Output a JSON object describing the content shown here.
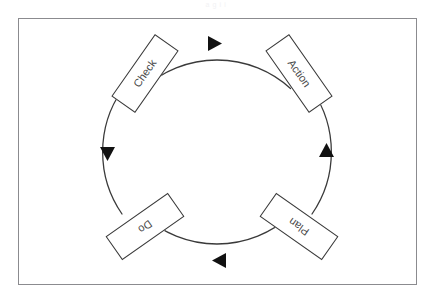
{
  "header": {
    "clipped_text": "a  g        i  i"
  },
  "diagram": {
    "type": "cycle",
    "direction": "clockwise",
    "stroke_color": "#3a3a3a",
    "frame_color": "#8b8b8f",
    "background_color": "#ffffff",
    "circle": {
      "cx": 217,
      "cy": 152,
      "r": 109
    },
    "nodes": [
      {
        "label": "Action",
        "position": "top-right",
        "angle_deg": 55,
        "cx": 299,
        "cy": 73
      },
      {
        "label": "Plan",
        "position": "bottom-right",
        "angle_deg": 215,
        "cx": 299,
        "cy": 226
      },
      {
        "label": "Do",
        "position": "bottom-left",
        "angle_deg": 145,
        "cx": 145,
        "cy": 226
      },
      {
        "label": "Check",
        "position": "top-left",
        "angle_deg": 305,
        "cx": 145,
        "cy": 73
      }
    ],
    "arrowheads": [
      {
        "at": "top",
        "points": "right"
      },
      {
        "at": "right",
        "points": "down"
      },
      {
        "at": "bottom",
        "points": "left"
      },
      {
        "at": "left",
        "points": "up"
      }
    ]
  }
}
